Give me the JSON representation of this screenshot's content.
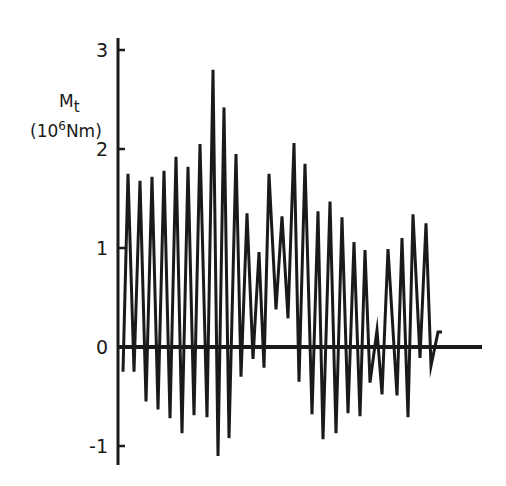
{
  "chart_data": {
    "type": "line",
    "title": "",
    "xlabel": "",
    "ylabel": "M_t (10^6 Nm)",
    "ylabel_parts": {
      "symbol": "M",
      "subscript": "t",
      "unit_open": "(10",
      "unit_exp": "6",
      "unit_close": "Nm)"
    },
    "ylim": [
      -1.1,
      3
    ],
    "yticks": [
      -1,
      0,
      1,
      2,
      3
    ],
    "ytick_labels": [
      "-1",
      "0",
      "1",
      "2",
      "3"
    ],
    "grid": false,
    "legend": null,
    "series": [
      {
        "name": "M_t",
        "x": [
          0,
          5,
          11,
          17,
          23,
          29,
          35,
          41,
          47,
          53,
          59,
          65,
          71,
          77,
          84,
          90,
          95,
          101,
          106,
          113,
          118,
          124,
          130,
          136,
          141,
          146,
          153,
          159,
          165,
          171,
          176,
          182,
          189,
          195,
          200,
          207,
          213,
          219,
          225,
          231,
          237,
          242,
          247,
          254,
          259,
          265,
          274,
          279,
          285,
          290,
          297,
          303,
          308,
          315,
          319
        ],
        "values": [
          -0.25,
          1.75,
          -0.25,
          1.68,
          -0.55,
          1.72,
          -0.63,
          1.78,
          -0.72,
          1.92,
          -0.87,
          1.82,
          -0.69,
          2.05,
          -0.71,
          2.8,
          -1.1,
          2.42,
          -0.92,
          1.95,
          -0.3,
          1.35,
          -0.12,
          0.96,
          -0.21,
          1.75,
          0.38,
          1.32,
          0.29,
          2.06,
          -0.35,
          1.85,
          -0.68,
          1.37,
          -0.93,
          1.47,
          -0.87,
          1.31,
          -0.67,
          1.06,
          -0.7,
          0.98,
          -0.36,
          0.17,
          -0.48,
          0.99,
          -0.49,
          1.1,
          -0.71,
          1.34,
          -0.11,
          1.25,
          -0.19,
          0.15,
          0.15
        ]
      }
    ],
    "plot": {
      "x0": 118,
      "zero_y": 347,
      "px_per_unit": 99,
      "axis_right": 482,
      "axis_top": 38,
      "axis_bottom": 465
    }
  }
}
